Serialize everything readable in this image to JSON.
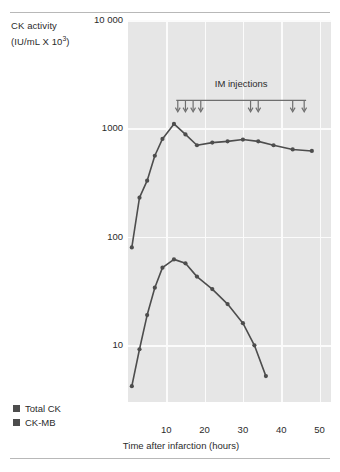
{
  "figure": {
    "y_axis_title_line1": "CK activity",
    "y_axis_title_line2_pre": "(IU/mL X 10",
    "y_axis_title_line2_sup": "3",
    "y_axis_title_line2_post": ")"
  },
  "legend": {
    "items": [
      {
        "label": "Total CK",
        "color": "#4d4d4d"
      },
      {
        "label": "CK-MB",
        "color": "#4d4d4d"
      }
    ]
  },
  "colors": {
    "plot_background": "#e6e6e6",
    "gridline": "#fbfbfb",
    "series": "#4d4d4d",
    "annotation": "#6e6e6e",
    "rule": "#b8b8b8",
    "text": "#2b2b2b"
  },
  "chart_data": {
    "type": "line",
    "title": "",
    "xlabel": "Time after infarction (hours)",
    "ylabel": "CK activity (IU/mL X 10^3)",
    "yscale": "log",
    "ylim": [
      3,
      10000
    ],
    "xlim": [
      0,
      53
    ],
    "yticks": [
      10000,
      1000,
      100,
      10
    ],
    "ytick_labels": [
      "10 000",
      "1000",
      "100",
      "10"
    ],
    "xticks": [
      10,
      20,
      30,
      40,
      50
    ],
    "xtick_labels": [
      "10",
      "20",
      "30",
      "40",
      "50"
    ],
    "grid": true,
    "legend_position": "bottom-left",
    "series": [
      {
        "name": "Total CK",
        "color": "#4d4d4d",
        "x": [
          1,
          3,
          5,
          7,
          9,
          12,
          15,
          18,
          22,
          26,
          30,
          34,
          38,
          43,
          48
        ],
        "values": [
          80,
          230,
          330,
          560,
          800,
          1100,
          880,
          700,
          740,
          760,
          790,
          760,
          700,
          640,
          620
        ]
      },
      {
        "name": "CK-MB",
        "color": "#4d4d4d",
        "x": [
          1,
          3,
          5,
          7,
          9,
          12,
          15,
          18,
          22,
          26,
          30,
          33,
          36
        ],
        "values": [
          4.2,
          9.2,
          19,
          34,
          52,
          62,
          57,
          43,
          33,
          24,
          16,
          10,
          5.2
        ]
      }
    ],
    "annotations": [
      {
        "text": "IM injections",
        "type": "bracket-with-arrows",
        "arrow_x": [
          13,
          15,
          17,
          19,
          32,
          34,
          43,
          46
        ],
        "bracket_x_range": [
          12.6,
          46.5
        ]
      }
    ]
  }
}
